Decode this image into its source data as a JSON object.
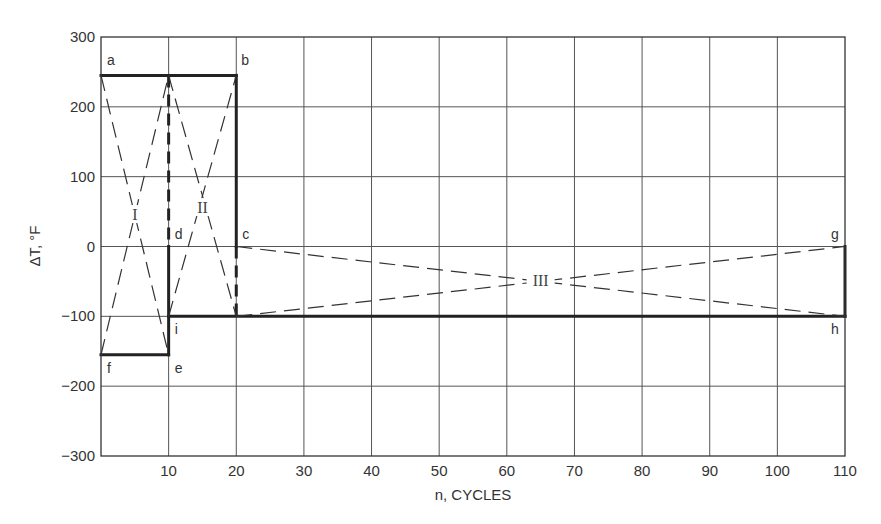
{
  "chart_data": {
    "type": "line",
    "title": "",
    "xlabel": "n, CYCLES",
    "ylabel": "ΔT, °F",
    "xlim": [
      0,
      110
    ],
    "ylim": [
      -300,
      300
    ],
    "x_ticks": [
      10,
      20,
      30,
      40,
      50,
      60,
      70,
      80,
      90,
      100,
      110
    ],
    "y_ticks": [
      300,
      200,
      100,
      0,
      -100,
      -200,
      -300
    ],
    "grid": true,
    "points": {
      "a": [
        0,
        245
      ],
      "b": [
        20,
        245
      ],
      "c": [
        20,
        0
      ],
      "d": [
        10,
        0
      ],
      "e": [
        10,
        -155
      ],
      "f": [
        0,
        -155
      ],
      "g": [
        110,
        0
      ],
      "h": [
        110,
        -100
      ],
      "i": [
        10,
        -100
      ]
    },
    "series": [
      {
        "name": "history (heavy solid)",
        "style": "heavy-solid",
        "segments": [
          [
            [
              0,
              245
            ],
            [
              20,
              245
            ]
          ],
          [
            [
              20,
              245
            ],
            [
              20,
              0
            ]
          ],
          [
            [
              0,
              -155
            ],
            [
              10,
              -155
            ]
          ],
          [
            [
              10,
              -155
            ],
            [
              10,
              0
            ]
          ],
          [
            [
              10,
              -100
            ],
            [
              110,
              -100
            ]
          ],
          [
            [
              110,
              -100
            ],
            [
              110,
              0
            ]
          ]
        ]
      },
      {
        "name": "history (heavy dashed)",
        "style": "heavy-dashed",
        "segments": [
          [
            [
              10,
              245
            ],
            [
              10,
              0
            ]
          ],
          [
            [
              20,
              0
            ],
            [
              20,
              -100
            ]
          ]
        ]
      },
      {
        "name": "I",
        "style": "thin-dashed",
        "segments": [
          [
            [
              0,
              245
            ],
            [
              10,
              -155
            ]
          ],
          [
            [
              0,
              -155
            ],
            [
              10,
              245
            ]
          ]
        ]
      },
      {
        "name": "II",
        "style": "thin-dashed",
        "segments": [
          [
            [
              10,
              245
            ],
            [
              20,
              -100
            ]
          ],
          [
            [
              10,
              -100
            ],
            [
              20,
              245
            ]
          ]
        ]
      },
      {
        "name": "III",
        "style": "thin-dashed",
        "segments": [
          [
            [
              20,
              0
            ],
            [
              110,
              -100
            ]
          ],
          [
            [
              20,
              -100
            ],
            [
              110,
              0
            ]
          ]
        ]
      }
    ],
    "annotations": [
      {
        "text": "I",
        "x": 5,
        "y": 45
      },
      {
        "text": "II",
        "x": 15,
        "y": 55
      },
      {
        "text": "III",
        "x": 65,
        "y": -50
      }
    ]
  },
  "labels": {
    "xlabel": "n, CYCLES",
    "ylabel": "ΔT, °F"
  }
}
